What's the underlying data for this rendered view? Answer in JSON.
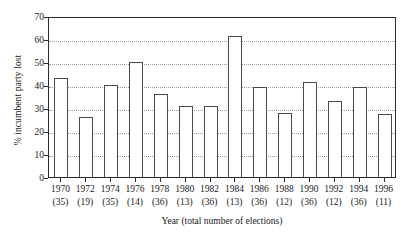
{
  "chart_data": {
    "type": "bar",
    "title": "",
    "subtitle": "",
    "xlabel": "Year (total number of elections)",
    "ylabel": "% incumbent party lost",
    "categories": [
      "1970",
      "1972",
      "1974",
      "1976",
      "1978",
      "1980",
      "1982",
      "1984",
      "1986",
      "1988",
      "1990",
      "1992",
      "1994",
      "1996"
    ],
    "category_sublabels": [
      "(35)",
      "(19)",
      "(35)",
      "(14)",
      "(36)",
      "(13)",
      "(36)",
      "(13)",
      "(36)",
      "(12)",
      "(36)",
      "(12)",
      "(36)",
      "(11)"
    ],
    "values": [
      43,
      26,
      40,
      50,
      36,
      31,
      31,
      61.5,
      39,
      28,
      41.5,
      33,
      39,
      27.5
    ],
    "ylim": [
      0,
      70
    ],
    "yticks": [
      0,
      10,
      20,
      30,
      40,
      50,
      60,
      70
    ],
    "ytick_labels": [
      "0",
      "10",
      "20",
      "30",
      "40",
      "50",
      "60",
      "70"
    ],
    "grid": "horizontal-dotted",
    "legend": "none",
    "bar_fill": "#ffffff",
    "bar_edge": "#4a4a4a",
    "axis_color": "#2b2b2b",
    "grid_color": "#9a9a9a",
    "background": "#ffffff"
  }
}
